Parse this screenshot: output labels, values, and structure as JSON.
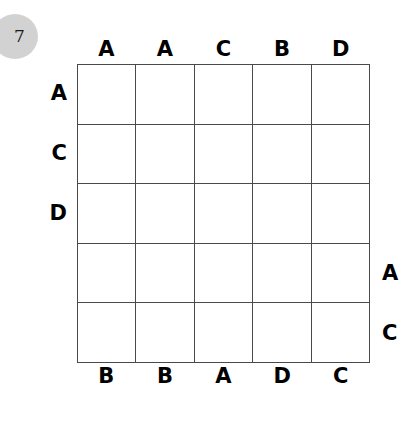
{
  "puzzle": {
    "number": "7",
    "grid_size": 5,
    "badge_color": "#d2d2d2",
    "line_color": "#4a4a4a",
    "cell_color": "#ffffff",
    "text_color": "#000000"
  },
  "clues": {
    "top": [
      "A",
      "A",
      "C",
      "B",
      "D"
    ],
    "bottom": [
      "B",
      "B",
      "A",
      "D",
      "C"
    ],
    "left": [
      "A",
      "C",
      "D",
      "",
      ""
    ],
    "right": [
      "",
      "",
      "",
      "A",
      "C"
    ]
  },
  "grid": {
    "cells": [
      [
        "",
        "",
        "",
        "",
        ""
      ],
      [
        "",
        "",
        "",
        "",
        ""
      ],
      [
        "",
        "",
        "",
        "",
        ""
      ],
      [
        "",
        "",
        "",
        "",
        ""
      ],
      [
        "",
        "",
        "",
        "",
        ""
      ]
    ]
  }
}
